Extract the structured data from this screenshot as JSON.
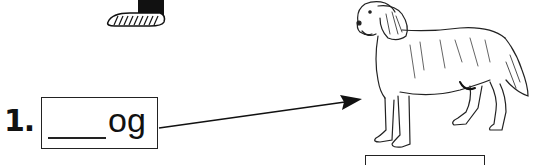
{
  "worksheet": {
    "item_number": "1.",
    "word_suffix": "og",
    "blank": "____",
    "picture": "dog",
    "colors": {
      "ink": "#111111",
      "background": "#ffffff"
    }
  }
}
